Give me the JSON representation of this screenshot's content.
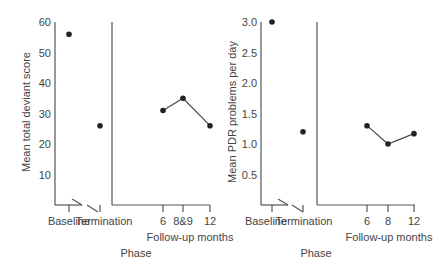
{
  "chart_data": [
    {
      "type": "line",
      "title": "",
      "ylabel": "Mean total deviant score",
      "xlabel": "Phase",
      "xlabel_sub": "Follow-up months",
      "ylim": [
        0,
        60
      ],
      "yticks": [
        "10",
        "20",
        "30",
        "40",
        "50",
        "60"
      ],
      "categories": [
        "Baseline",
        "Termination",
        "6",
        "8&9",
        "12"
      ],
      "values": [
        56,
        26,
        31,
        35,
        26
      ],
      "connected_segment": [
        "6",
        "8&9",
        "12"
      ],
      "grid": false,
      "legend": null
    },
    {
      "type": "line",
      "title": "",
      "ylabel": "Mean PDR problems per day",
      "xlabel": "Phase",
      "xlabel_sub": "Follow-up months",
      "ylim": [
        0,
        3.0
      ],
      "yticks": [
        "0.5",
        "1.0",
        "1.5",
        "2.0",
        "2.5",
        "3.0"
      ],
      "categories": [
        "Baseline",
        "Termination",
        "6",
        "8",
        "12"
      ],
      "values": [
        3.0,
        1.2,
        1.3,
        1.0,
        1.17
      ],
      "connected_segment": [
        "6",
        "8",
        "12"
      ],
      "grid": false,
      "legend": null
    }
  ]
}
